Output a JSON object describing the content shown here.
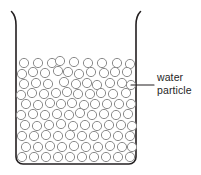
{
  "figure": {
    "type": "science-diagram",
    "background_color": "#ffffff"
  },
  "beaker": {
    "name": "beaker",
    "outline_color": "#231f20",
    "outline_width": 1.6,
    "left_wall_x": 16,
    "right_wall_x": 136,
    "top_y": 12,
    "bottom_y": 164,
    "corner_radius": 7,
    "lip_flare": "outward-curved rim at top of both walls"
  },
  "particles": {
    "name": "water-particles",
    "shape": "circle",
    "outline_color": "#8a8a8a",
    "fill_color": "#ffffff",
    "radius": 4.6,
    "count": 77,
    "fill_level_top_y": 57,
    "positions": [
      [
        24,
        63
      ],
      [
        38,
        63
      ],
      [
        52,
        63
      ],
      [
        60,
        61
      ],
      [
        74,
        62
      ],
      [
        88,
        63
      ],
      [
        102,
        63
      ],
      [
        117,
        63
      ],
      [
        130,
        64
      ],
      [
        22,
        74
      ],
      [
        33,
        72
      ],
      [
        45,
        73
      ],
      [
        58,
        71
      ],
      [
        68,
        72
      ],
      [
        79,
        74
      ],
      [
        91,
        72
      ],
      [
        104,
        73
      ],
      [
        115,
        72
      ],
      [
        127,
        72
      ],
      [
        24,
        84
      ],
      [
        36,
        83
      ],
      [
        48,
        84
      ],
      [
        64,
        82
      ],
      [
        76,
        84
      ],
      [
        87,
        83
      ],
      [
        97,
        85
      ],
      [
        110,
        83
      ],
      [
        122,
        83
      ],
      [
        131,
        85
      ],
      [
        21,
        95
      ],
      [
        32,
        93
      ],
      [
        44,
        94
      ],
      [
        56,
        93
      ],
      [
        67,
        92
      ],
      [
        78,
        94
      ],
      [
        90,
        94
      ],
      [
        101,
        93
      ],
      [
        113,
        94
      ],
      [
        126,
        93
      ],
      [
        26,
        104
      ],
      [
        38,
        105
      ],
      [
        50,
        103
      ],
      [
        61,
        104
      ],
      [
        72,
        103
      ],
      [
        84,
        105
      ],
      [
        95,
        104
      ],
      [
        107,
        104
      ],
      [
        119,
        104
      ],
      [
        131,
        104
      ],
      [
        21,
        115
      ],
      [
        33,
        114
      ],
      [
        45,
        115
      ],
      [
        57,
        114
      ],
      [
        69,
        115
      ],
      [
        80,
        113
      ],
      [
        92,
        115
      ],
      [
        104,
        114
      ],
      [
        116,
        115
      ],
      [
        128,
        114
      ],
      [
        25,
        125
      ],
      [
        37,
        126
      ],
      [
        49,
        125
      ],
      [
        61,
        124
      ],
      [
        73,
        126
      ],
      [
        85,
        125
      ],
      [
        97,
        126
      ],
      [
        109,
        125
      ],
      [
        121,
        125
      ],
      [
        132,
        126
      ],
      [
        22,
        136
      ],
      [
        34,
        136
      ],
      [
        46,
        135
      ],
      [
        58,
        136
      ],
      [
        70,
        135
      ],
      [
        82,
        136
      ],
      [
        94,
        136
      ],
      [
        106,
        135
      ],
      [
        118,
        136
      ],
      [
        130,
        136
      ],
      [
        26,
        147
      ],
      [
        38,
        147
      ],
      [
        50,
        146
      ],
      [
        62,
        147
      ],
      [
        74,
        146
      ],
      [
        86,
        147
      ],
      [
        98,
        147
      ],
      [
        110,
        146
      ],
      [
        122,
        147
      ],
      [
        132,
        147
      ],
      [
        22,
        157
      ],
      [
        34,
        157
      ],
      [
        46,
        157
      ],
      [
        58,
        157
      ],
      [
        70,
        157
      ],
      [
        82,
        157
      ],
      [
        94,
        157
      ],
      [
        106,
        157
      ],
      [
        118,
        157
      ],
      [
        130,
        157
      ]
    ]
  },
  "callout": {
    "name": "water-particle-callout",
    "leader_line": {
      "from_x": 131,
      "from_y": 85,
      "to_x": 154,
      "to_y": 85,
      "color": "#231f20"
    },
    "label_line1": "water",
    "label_line2": "particle",
    "text_color": "#262626"
  }
}
